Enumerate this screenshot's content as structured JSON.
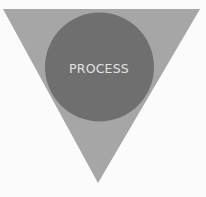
{
  "diagram": {
    "type": "funnel-triangle-with-circle",
    "shapes": [
      {
        "kind": "inverted-triangle",
        "role": "outer",
        "color": "#a6a6a6"
      },
      {
        "kind": "circle",
        "role": "inner",
        "color": "#6f6f6f",
        "label": "PROCESS",
        "label_color": "#e2e2e2"
      }
    ],
    "background": "#fbfbfb"
  }
}
